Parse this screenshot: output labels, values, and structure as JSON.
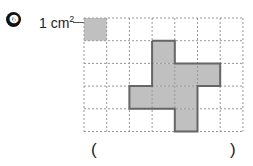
{
  "problem": {
    "number": "6",
    "unit_label": "1 cm",
    "unit_sup": "2"
  },
  "grid": {
    "cols": 7,
    "rows": 5,
    "x0": 84,
    "y0": 18,
    "cell": 22.7,
    "unit_cell": [
      0,
      0
    ],
    "shape_cells": [
      [
        3,
        1
      ],
      [
        3,
        2
      ],
      [
        4,
        2
      ],
      [
        5,
        2
      ],
      [
        2,
        3
      ],
      [
        3,
        3
      ],
      [
        4,
        3
      ],
      [
        4,
        4
      ]
    ],
    "fill": "#c0c0c0",
    "stroke": "#666666"
  },
  "answer": {
    "open": "(",
    "close": ")"
  }
}
